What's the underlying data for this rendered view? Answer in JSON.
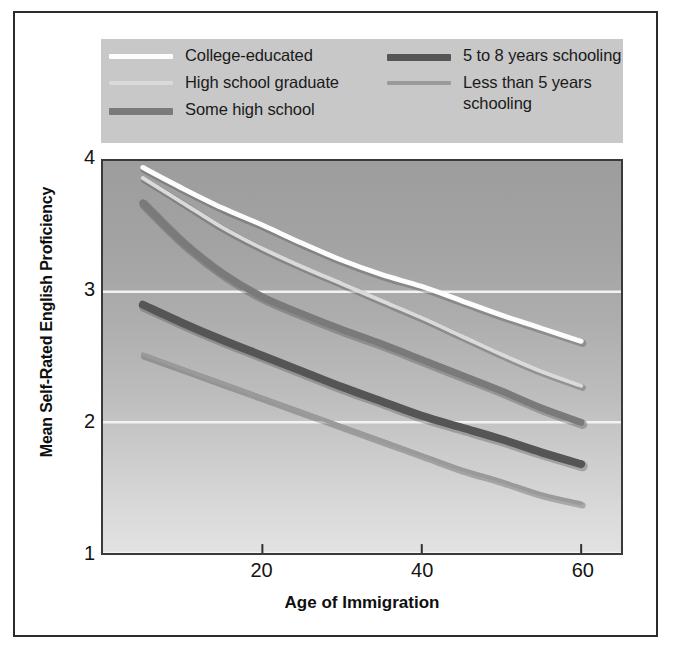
{
  "figure": {
    "background_color": "#ffffff",
    "frame_color": "#2b2b2b"
  },
  "legend": {
    "background_color": "#c8c8c8",
    "entries": [
      {
        "label": "College-educated",
        "color": "#fdfdfd",
        "thickness_px": 5,
        "column": "left",
        "row": 0
      },
      {
        "label": "High school graduate",
        "color": "#dadada",
        "thickness_px": 4,
        "column": "left",
        "row": 1
      },
      {
        "label": "Some high school",
        "color": "#7a7a7a",
        "thickness_px": 7,
        "column": "left",
        "row": 2
      },
      {
        "label": "5 to 8 years schooling",
        "color": "#555555",
        "thickness_px": 7,
        "column": "right",
        "row": 0
      },
      {
        "label": "Less than 5 years\nschooling",
        "color": "#9a9a9a",
        "thickness_px": 4,
        "column": "right",
        "row": 1
      }
    ]
  },
  "axes": {
    "y_label": "Mean Self-Rated English Proficiency",
    "x_label": "Age of Immigration",
    "y_ticks": [
      "4",
      "3",
      "2",
      "1"
    ],
    "x_ticks": [
      "20",
      "40",
      "60"
    ]
  },
  "chart_data": {
    "type": "line",
    "title": "",
    "subtitle": "",
    "xlabel": "Age of Immigration",
    "ylabel": "Mean Self-Rated English Proficiency",
    "xlim": [
      0,
      65
    ],
    "ylim": [
      1,
      4
    ],
    "x_ticks": [
      20,
      40,
      60
    ],
    "y_ticks": [
      1,
      2,
      3,
      4
    ],
    "grid": "horizontal-white",
    "legend_position": "top",
    "x": [
      5,
      10,
      15,
      20,
      25,
      30,
      35,
      40,
      45,
      50,
      55,
      60
    ],
    "series": [
      {
        "name": "College-educated",
        "color": "#fdfdfd",
        "thickness_px": 5,
        "values": [
          3.95,
          3.79,
          3.64,
          3.51,
          3.37,
          3.24,
          3.13,
          3.04,
          2.93,
          2.82,
          2.72,
          2.62
        ]
      },
      {
        "name": "High school graduate",
        "color": "#dadada",
        "thickness_px": 4,
        "values": [
          3.87,
          3.68,
          3.49,
          3.33,
          3.19,
          3.06,
          2.93,
          2.8,
          2.66,
          2.52,
          2.39,
          2.28
        ]
      },
      {
        "name": "Some high school",
        "color": "#7a7a7a",
        "thickness_px": 7,
        "values": [
          3.68,
          3.38,
          3.14,
          2.96,
          2.83,
          2.71,
          2.6,
          2.48,
          2.36,
          2.24,
          2.11,
          2.0
        ]
      },
      {
        "name": "5 to 8 years schooling",
        "color": "#555555",
        "thickness_px": 8,
        "values": [
          2.9,
          2.76,
          2.63,
          2.51,
          2.39,
          2.27,
          2.16,
          2.05,
          1.96,
          1.87,
          1.77,
          1.68
        ]
      },
      {
        "name": "Less than 5 years schooling",
        "color": "#9a9a9a",
        "thickness_px": 4,
        "values": [
          2.52,
          2.41,
          2.3,
          2.19,
          2.08,
          1.97,
          1.86,
          1.75,
          1.64,
          1.55,
          1.45,
          1.38
        ]
      }
    ]
  }
}
